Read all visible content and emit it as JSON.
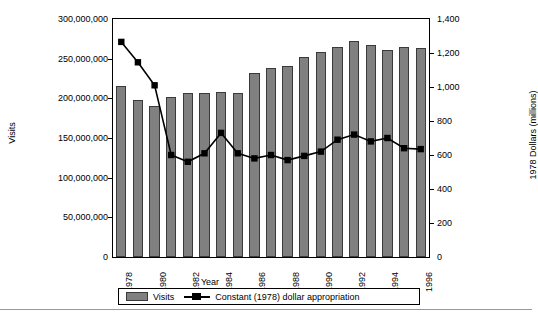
{
  "chart_data": {
    "type": "bar",
    "title": "",
    "xlabel": "Year",
    "ylabel": "Visits",
    "y2label": "1978 Dollars (millions)",
    "grid": false,
    "legend_position": "bottom",
    "ylim": [
      0,
      300000000
    ],
    "y2lim": [
      0,
      1400
    ],
    "yticks": [
      "0",
      "50,000,000",
      "100,000,000",
      "150,000,000",
      "200,000,000",
      "250,000,000",
      "300,000,000"
    ],
    "ytick_values": [
      0,
      50000000,
      100000000,
      150000000,
      200000000,
      250000000,
      300000000
    ],
    "y2ticks": [
      "0",
      "200",
      "400",
      "600",
      "800",
      "1,000",
      "1,200",
      "1,400"
    ],
    "y2tick_values": [
      0,
      200,
      400,
      600,
      800,
      1000,
      1200,
      1400
    ],
    "categories": [
      1978,
      1979,
      1980,
      1981,
      1982,
      1983,
      1984,
      1985,
      1986,
      1987,
      1988,
      1989,
      1990,
      1991,
      1992,
      1993,
      1994,
      1995,
      1996
    ],
    "xtick_labels": [
      "1978",
      "1980",
      "1982",
      "1984",
      "1986",
      "1988",
      "1990",
      "1992",
      "1994",
      "1996"
    ],
    "xtick_categories": [
      1978,
      1980,
      1982,
      1984,
      1986,
      1988,
      1990,
      1992,
      1994,
      1996
    ],
    "series": [
      {
        "name": "Visits",
        "type": "bar",
        "axis": "left",
        "color": "#808080",
        "values": [
          215000000,
          198000000,
          190000000,
          202000000,
          207000000,
          207000000,
          208000000,
          207000000,
          232000000,
          238000000,
          241000000,
          252000000,
          258000000,
          265000000,
          272000000,
          267000000,
          261000000,
          265000000,
          263000000
        ]
      },
      {
        "name": "Constant (1978) dollar appropriation",
        "type": "line",
        "axis": "right",
        "color": "#000000",
        "marker": "square",
        "values": [
          1265,
          1145,
          1010,
          600,
          560,
          610,
          730,
          610,
          580,
          600,
          570,
          595,
          620,
          690,
          720,
          680,
          700,
          640,
          635
        ]
      }
    ]
  },
  "legend": {
    "items": [
      {
        "label": "Visits",
        "marker": "bar-swatch"
      },
      {
        "label": "Constant (1978) dollar appropriation",
        "marker": "line-square"
      }
    ]
  }
}
